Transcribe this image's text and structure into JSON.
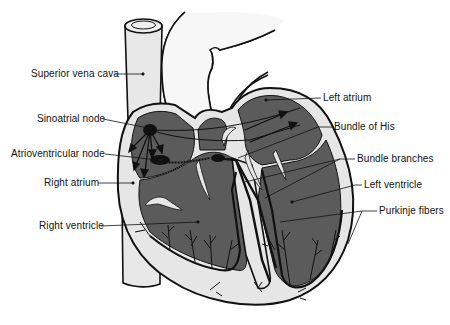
{
  "colors": {
    "chamber": "#5b5b5b",
    "wall": "#e6e6e6",
    "vessel": "#e8e8e8",
    "outline": "#111111",
    "background": "#ffffff"
  },
  "labels": {
    "left_side": [
      {
        "id": "superior-vena-cava",
        "text": "Superior vena cava",
        "x": 31,
        "y": 68
      },
      {
        "id": "sinoatrial-node",
        "text": "Sinoatrial node",
        "x": 37,
        "y": 113
      },
      {
        "id": "atrioventricular-node",
        "text": "Atrioventricular node",
        "x": 11,
        "y": 148
      },
      {
        "id": "right-atrium",
        "text": "Right atrium",
        "x": 44,
        "y": 177
      },
      {
        "id": "right-ventricle",
        "text": "Right ventricle",
        "x": 39,
        "y": 220
      }
    ],
    "right_side": [
      {
        "id": "left-atrium",
        "text": "Left atrium",
        "x": 323,
        "y": 92
      },
      {
        "id": "bundle-of-his",
        "text": "Bundle of His",
        "x": 334,
        "y": 121
      },
      {
        "id": "bundle-branches",
        "text": "Bundle branches",
        "x": 357,
        "y": 153
      },
      {
        "id": "left-ventricle",
        "text": "Left ventricle",
        "x": 364,
        "y": 179
      },
      {
        "id": "purkinje-fibers",
        "text": "Purkinje fibers",
        "x": 379,
        "y": 205
      }
    ]
  }
}
